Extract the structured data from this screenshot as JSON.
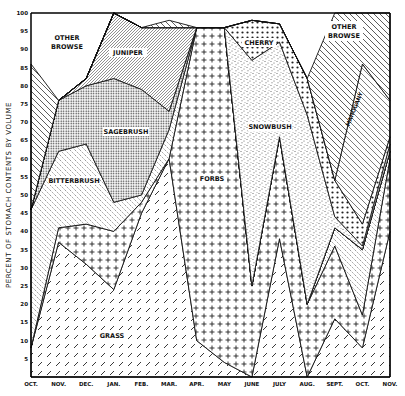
{
  "chart_data": {
    "type": "area",
    "stacked": true,
    "title": "",
    "xlabel": "",
    "ylabel": "PERCENT OF STOMACH CONTENTS BY VOLUME",
    "ylim": [
      0,
      100
    ],
    "yticks": [
      5,
      10,
      15,
      20,
      25,
      30,
      35,
      40,
      45,
      50,
      55,
      60,
      65,
      70,
      75,
      80,
      85,
      90,
      95,
      100
    ],
    "categories": [
      "OCT.",
      "NOV.",
      "DEC.",
      "JAN.",
      "FEB.",
      "MAR.",
      "APR.",
      "MAY",
      "JUNE",
      "JULY",
      "AUG.",
      "SEPT.",
      "OCT.",
      "NOV."
    ],
    "cumulative_tops": {
      "Grass": [
        8,
        37,
        31,
        24,
        45,
        60,
        10,
        4,
        0,
        38,
        0,
        16,
        8,
        40
      ],
      "Forbs": [
        8,
        41,
        42,
        40,
        48,
        60,
        96,
        96,
        25,
        66,
        20,
        36,
        17,
        60
      ],
      "Bitterbrush": [
        46,
        62,
        64,
        48,
        50,
        68,
        96,
        96,
        25,
        66,
        20,
        41,
        35,
        62
      ],
      "Sagebrush": [
        46,
        76,
        80,
        82,
        79,
        73,
        96,
        96,
        25,
        66,
        20,
        41,
        35,
        62
      ],
      "Juniper": [
        46,
        76,
        82,
        100,
        96,
        96,
        96,
        96,
        25,
        66,
        20,
        41,
        35,
        62
      ],
      "Snowbush": [
        46,
        76,
        82,
        100,
        96,
        96,
        96,
        96,
        87,
        92,
        72,
        44,
        36,
        64
      ],
      "Cherry": [
        46,
        76,
        82,
        100,
        96,
        96,
        96,
        96,
        98,
        97,
        82,
        54,
        42,
        66
      ],
      "Mahogany": [
        46,
        76,
        82,
        100,
        96,
        96,
        96,
        96,
        98,
        97,
        82,
        54,
        86,
        76
      ],
      "Other browse": [
        86,
        76,
        82,
        100,
        96,
        98,
        96,
        96,
        98,
        97,
        82,
        100,
        100,
        100
      ]
    },
    "series": [
      {
        "name": "Grass",
        "values": [
          8,
          37,
          31,
          24,
          45,
          60,
          10,
          4,
          0,
          38,
          0,
          16,
          8,
          40
        ]
      },
      {
        "name": "Forbs",
        "values": [
          0,
          4,
          11,
          16,
          3,
          0,
          86,
          92,
          25,
          28,
          20,
          20,
          9,
          20
        ]
      },
      {
        "name": "Bitterbrush",
        "values": [
          38,
          21,
          22,
          8,
          2,
          8,
          0,
          0,
          0,
          0,
          0,
          5,
          18,
          2
        ]
      },
      {
        "name": "Sagebrush",
        "values": [
          0,
          14,
          16,
          34,
          29,
          5,
          0,
          0,
          0,
          0,
          0,
          0,
          0,
          0
        ]
      },
      {
        "name": "Juniper",
        "values": [
          0,
          0,
          2,
          18,
          17,
          23,
          0,
          0,
          0,
          0,
          0,
          0,
          0,
          0
        ]
      },
      {
        "name": "Snowbush",
        "values": [
          0,
          0,
          0,
          0,
          0,
          0,
          0,
          0,
          62,
          26,
          52,
          3,
          1,
          2
        ]
      },
      {
        "name": "Cherry",
        "values": [
          0,
          0,
          0,
          0,
          0,
          0,
          0,
          0,
          11,
          5,
          10,
          10,
          6,
          2
        ]
      },
      {
        "name": "Mahogany",
        "values": [
          0,
          0,
          0,
          0,
          0,
          0,
          0,
          0,
          0,
          0,
          0,
          0,
          44,
          10
        ]
      },
      {
        "name": "Other browse",
        "values": [
          40,
          0,
          0,
          0,
          0,
          2,
          0,
          0,
          0,
          0,
          0,
          46,
          14,
          24
        ]
      }
    ],
    "annotations": [
      "OTHER BROWSE",
      "JUNIPER",
      "SAGEBRUSH",
      "BITTERBRUSH",
      "GRASS",
      "FORBS",
      "CHERRY",
      "SNOWBUSH",
      "OTHER BROWSE",
      "MAHOGANY"
    ],
    "grid": false,
    "legend": "inline labels"
  },
  "labels": {
    "ylabel": "PERCENT OF STOMACH CONTENTS BY VOLUME",
    "other_browse_left_1": "OTHER",
    "other_browse_left_2": "BROWSE",
    "juniper": "JUNIPER",
    "sagebrush": "SAGEBRUSH",
    "bitterbrush": "BITTERBRUSH",
    "grass": "GRASS",
    "forbs": "FORBS",
    "cherry": "CHERRY",
    "snowbush": "SNOWBUSH",
    "other_browse_right_1": "OTHER",
    "other_browse_right_2": "BROWSE",
    "mahogany": "MAHOGANY"
  }
}
